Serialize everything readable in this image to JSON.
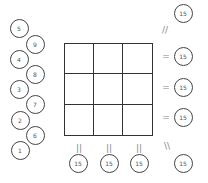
{
  "left_numbers": [
    {
      "label": "5",
      "x": 19,
      "y": 28
    },
    {
      "label": "9",
      "x": 35,
      "y": 44
    },
    {
      "label": "4",
      "x": 19,
      "y": 59
    },
    {
      "label": "8",
      "x": 35,
      "y": 74
    },
    {
      "label": "3",
      "x": 19,
      "y": 89
    },
    {
      "label": "7",
      "x": 35,
      "y": 104
    },
    {
      "label": "2",
      "x": 20,
      "y": 120
    },
    {
      "label": "6",
      "x": 35,
      "y": 135
    },
    {
      "label": "1",
      "x": 20,
      "y": 150
    }
  ],
  "grid": {
    "rows": 3,
    "cols": 3,
    "cells": [
      "",
      "",
      "",
      "",
      "",
      "",
      "",
      "",
      ""
    ]
  },
  "sums": {
    "diag_top": {
      "label": "15",
      "x": 183,
      "y": 13,
      "symbol": "//",
      "sx": 165,
      "sy": 30
    },
    "rows": [
      {
        "label": "15",
        "x": 183,
        "y": 56,
        "symbol": "=",
        "sx": 166,
        "sy": 56
      },
      {
        "label": "15",
        "x": 183,
        "y": 87,
        "symbol": "=",
        "sx": 166,
        "sy": 87
      },
      {
        "label": "15",
        "x": 183,
        "y": 117,
        "symbol": "=",
        "sx": 166,
        "sy": 117
      }
    ],
    "cols": [
      {
        "label": "15",
        "x": 78,
        "y": 163,
        "symbol": "||",
        "sx": 79,
        "sy": 148
      },
      {
        "label": "15",
        "x": 109,
        "y": 163,
        "symbol": "||",
        "sx": 109,
        "sy": 148
      },
      {
        "label": "15",
        "x": 139,
        "y": 163,
        "symbol": "||",
        "sx": 139,
        "sy": 148
      }
    ],
    "diag_bottom": {
      "label": "15",
      "x": 183,
      "y": 163,
      "symbol": "\\\\",
      "sx": 167,
      "sy": 146
    }
  }
}
